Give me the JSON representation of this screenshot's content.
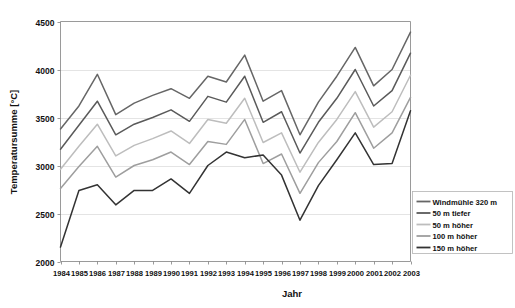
{
  "chart_data": {
    "type": "line",
    "title": "",
    "xlabel": "Jahr",
    "ylabel": "Temperatursumme [°C]",
    "xlim": [
      1984,
      2003
    ],
    "ylim": [
      2000,
      4500
    ],
    "yticks": [
      2000,
      2500,
      3000,
      3500,
      4000,
      4500
    ],
    "grid": true,
    "legend_position": "bottom-right",
    "categories": [
      "1984",
      "1985",
      "1986",
      "1987",
      "1988",
      "1989",
      "1990",
      "1991",
      "1992",
      "1993",
      "1994",
      "1995",
      "1996",
      "1997",
      "1998",
      "1999",
      "2000",
      "2001",
      "2002",
      "2003"
    ],
    "series": [
      {
        "name": "Windmühle 320 m",
        "color": "#666666",
        "values": [
          3380,
          3620,
          3950,
          3530,
          3650,
          3730,
          3800,
          3700,
          3930,
          3870,
          4150,
          3670,
          3780,
          3320,
          3660,
          3930,
          4230,
          3830,
          4000,
          4390
        ]
      },
      {
        "name": "50 m tiefer",
        "color": "#5a5a5a",
        "values": [
          3170,
          3420,
          3670,
          3320,
          3430,
          3500,
          3580,
          3460,
          3720,
          3660,
          3930,
          3450,
          3560,
          3130,
          3450,
          3700,
          4000,
          3620,
          3780,
          4170
        ]
      },
      {
        "name": "50 m höher",
        "color": "#bdbdbd",
        "values": [
          2960,
          3200,
          3430,
          3100,
          3210,
          3280,
          3360,
          3230,
          3480,
          3440,
          3700,
          3240,
          3340,
          2930,
          3240,
          3480,
          3770,
          3400,
          3560,
          3940
        ]
      },
      {
        "name": "100 m höher",
        "color": "#9e9e9e",
        "values": [
          2760,
          2990,
          3200,
          2880,
          3000,
          3060,
          3140,
          3010,
          3250,
          3220,
          3480,
          3020,
          3120,
          2710,
          3030,
          3250,
          3550,
          3180,
          3340,
          3710
        ]
      },
      {
        "name": "150 m höher",
        "color": "#333333",
        "values": [
          2150,
          2740,
          2800,
          2590,
          2740,
          2740,
          2860,
          2710,
          3000,
          3140,
          3080,
          3110,
          2900,
          2430,
          2790,
          3060,
          3340,
          3010,
          3020,
          3570
        ]
      }
    ]
  },
  "legend": {
    "items": [
      {
        "label": "Windmühle 320 m"
      },
      {
        "label": "50 m tiefer"
      },
      {
        "label": "50 m höher"
      },
      {
        "label": "100 m höher"
      },
      {
        "label": "150 m höher"
      }
    ]
  }
}
